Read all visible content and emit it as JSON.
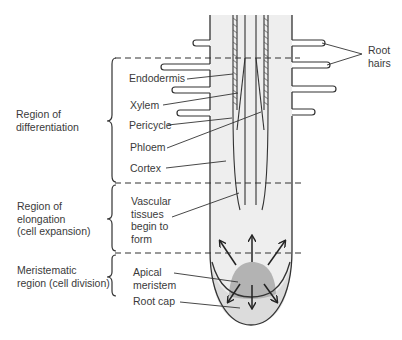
{
  "regions": [
    {
      "label_line1": "Region of",
      "label_line2": "differentiation",
      "label_line3": ""
    },
    {
      "label_line1": "Region of",
      "label_line2": "elongation",
      "label_line3": "(cell expansion)"
    },
    {
      "label_line1": "Meristematic",
      "label_line2": "region (cell division)",
      "label_line3": ""
    }
  ],
  "labels": {
    "endodermis": "Endodermis",
    "xylem": "Xylem",
    "pericycle": "Pericycle",
    "phloem": "Phloem",
    "cortex": "Cortex",
    "vascular_1": "Vascular",
    "vascular_2": "tissues",
    "vascular_3": "begin to",
    "vascular_4": "form",
    "apical_1": "Apical",
    "apical_2": "meristem",
    "root_cap": "Root cap",
    "root_hairs_1": "Root",
    "root_hairs_2": "hairs"
  },
  "colors": {
    "line": "#333333",
    "root_fill": "#eeeeee",
    "cap_fill": "#dcdcdc",
    "meristem_fill": "#b3b3b3",
    "text": "#3a3a3a"
  }
}
